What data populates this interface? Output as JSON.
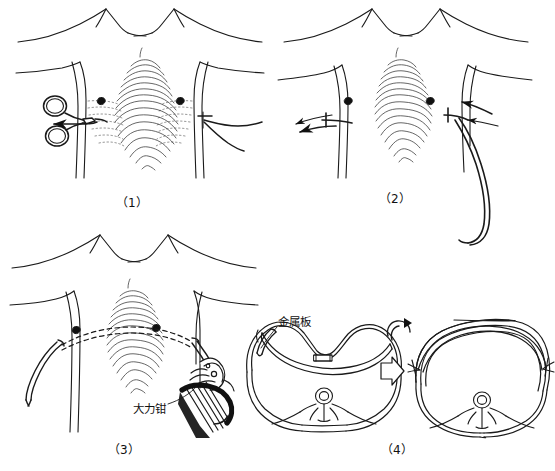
{
  "figure": {
    "title_alt": "Nuss procedure for pectus excavatum repair",
    "background_color": "#ffffff",
    "ink_color": "#1a1a1a",
    "width": 555,
    "height": 471
  },
  "panels": [
    {
      "id": "panel-1",
      "caption": "（1）",
      "view": "anterior chest",
      "contents": [
        "shoulders and neck contours",
        "both nipples marked",
        "central sternal depression shown with stippled hatching",
        "ring-handled clamp inserted at left lateral incision",
        "arrow pointing left indicating tunneling direction",
        "suture threads exiting right lateral incision"
      ]
    },
    {
      "id": "panel-2",
      "caption": "（2）",
      "view": "anterior chest",
      "contents": [
        "shoulders and neck contours",
        "both nipples marked",
        "central sternal depression shown with stippled hatching",
        "left lateral incision with arrow pointing left",
        "curved metal introducer bar entering right lateral incision",
        "arrow pointing left-up indicating bar advance"
      ]
    },
    {
      "id": "panel-3",
      "caption": "（3）",
      "view": "anterior chest",
      "label": "大力钳",
      "contents": [
        "shoulders and neck contours",
        "both nipples marked",
        "central sternal depression shown with stippled hatching",
        "support bar passed across the chest beneath the sternum, shown dashed",
        "bar ends emerging at both lateral incisions",
        "vice-grip pliers clamped on the right bar end"
      ]
    },
    {
      "id": "panel-4",
      "caption": "（4）",
      "view": "axial cross-section",
      "label": "金属板",
      "contents": [
        "left cross-section: depressed sternum with bar convexity facing posteriorly",
        "outlined right-pointing arrow between the two cross-sections",
        "right cross-section: bar rotated 180 degrees, chest contour corrected",
        "vertebral body drawn at the posterior midline of both sections",
        "rotation arrow at the right bar end of the left cross-section"
      ]
    }
  ],
  "labels": {
    "pliers": "大力钳",
    "metal_plate": "金属板"
  },
  "captions": {
    "p1": "（1）",
    "p2": "（2）",
    "p3": "（3）",
    "p4": "（4）"
  }
}
